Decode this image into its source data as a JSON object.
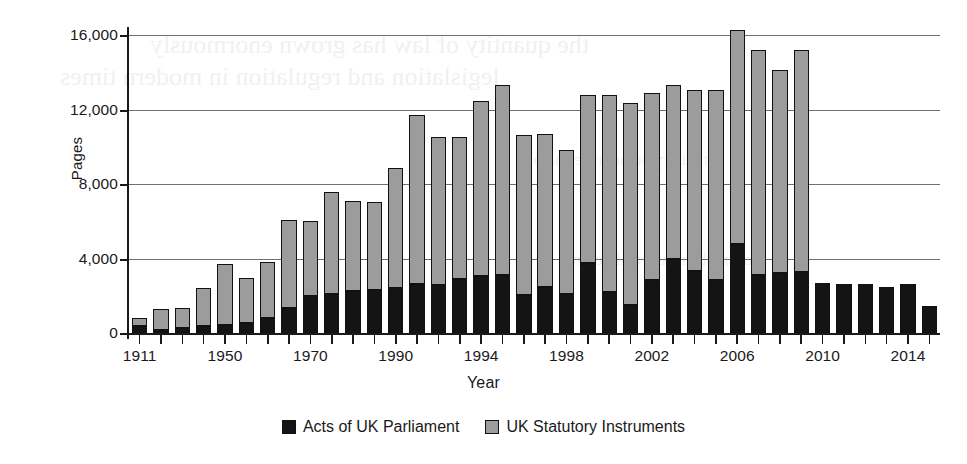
{
  "chart_data": {
    "type": "bar",
    "stacked": true,
    "title": "",
    "xlabel": "Year",
    "ylabel": "Pages",
    "ylim": [
      0,
      16000
    ],
    "yticks": [
      0,
      4000,
      8000,
      12000,
      16000
    ],
    "ytick_labels": [
      "0",
      "4,000",
      "8,000",
      "12,000",
      "16,000"
    ],
    "grid": true,
    "legend_position": "bottom",
    "xtick_labels": [
      "1911",
      "1950",
      "1970",
      "1990",
      "1994",
      "1998",
      "2002",
      "2006",
      "2010",
      "2014"
    ],
    "categories": [
      "1911",
      "1920",
      "1930",
      "1940",
      "1950",
      "1955",
      "1960",
      "1965",
      "1970",
      "1975",
      "1980",
      "1985",
      "1990",
      "1991",
      "1992",
      "1993",
      "1994",
      "1995",
      "1996",
      "1997",
      "1998",
      "1999",
      "2000",
      "2001",
      "2002",
      "2003",
      "2004",
      "2005",
      "2006",
      "2007",
      "2008",
      "2009",
      "2010",
      "2011",
      "2012",
      "2013",
      "2014",
      "2015"
    ],
    "series": [
      {
        "name": "Acts of UK Parliament",
        "color": "#141414",
        "values": [
          350,
          170,
          290,
          400,
          450,
          520,
          800,
          1350,
          2000,
          2100,
          2250,
          2300,
          2400,
          2650,
          2600,
          2900,
          3050,
          3100,
          2050,
          2450,
          2100,
          3750,
          2200,
          1500,
          2850,
          4000,
          3350,
          2850,
          4800,
          3100,
          3200,
          3300,
          2700,
          2650,
          2650,
          2450,
          2650,
          1450
        ]
      },
      {
        "name": "UK Statutory Instruments",
        "color": "#9c9c9c",
        "values": [
          450,
          1100,
          1050,
          2000,
          3250,
          2450,
          3000,
          4700,
          4000,
          5450,
          4850,
          4750,
          6450,
          9050,
          7950,
          7600,
          9400,
          10200,
          8600,
          8250,
          7750,
          9050,
          10600,
          10850,
          10050,
          9300,
          9700,
          10200,
          11450,
          12100,
          10900,
          11900,
          0,
          0,
          0,
          0,
          0,
          0
        ]
      }
    ],
    "totals": [
      800,
      1270,
      1340,
      2400,
      3700,
      2970,
      3800,
      6050,
      6000,
      7550,
      7100,
      7050,
      8850,
      11700,
      10550,
      10500,
      12450,
      13300,
      10650,
      10700,
      9850,
      12800,
      12800,
      12350,
      12900,
      13300,
      13050,
      13050,
      16250,
      15200,
      14100,
      15200,
      2700,
      2650,
      2650,
      2450,
      2650,
      1450
    ]
  },
  "legend": {
    "items": [
      {
        "label": "Acts of UK Parliament",
        "color": "#141414"
      },
      {
        "label": "UK Statutory Instruments",
        "color": "#9c9c9c"
      }
    ]
  },
  "ghost_text": [
    "the quantity of law has grown enormously",
    "legislation and regulation in modern times",
    "statutory output rose sharply",
    "a simple measure of volume"
  ]
}
